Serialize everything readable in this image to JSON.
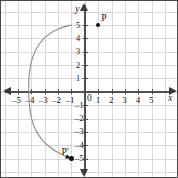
{
  "figure": {
    "title": "",
    "background_color": "#ffffff",
    "border_color": "#4a4a4a",
    "grid_color": "#d8d8d8",
    "axis_color": "#4f4f4f",
    "curve_color": "#8a8a8a",
    "point_color": "#111111"
  },
  "axes": {
    "x_name": "x",
    "y_name": "y",
    "origin_label": "0",
    "x_tick_labels": [
      "–5",
      "–4",
      "–3",
      "–2",
      "–1",
      "1",
      "2",
      "3",
      "4",
      "5"
    ],
    "y_tick_labels": [
      "5",
      "4",
      "3",
      "2",
      "1",
      "–1",
      "–2",
      "–3",
      "–4",
      "–5"
    ]
  },
  "points": [
    {
      "name": "P",
      "label": "P",
      "x": 1,
      "y": 5
    },
    {
      "name": "P'",
      "label": "P′",
      "x": -1,
      "y": -5
    }
  ],
  "chart_data": {
    "type": "line",
    "title": "",
    "xlabel": "x",
    "ylabel": "y",
    "xlim": [
      -5.6,
      5.6
    ],
    "ylim": [
      -5.6,
      5.6
    ],
    "grid": true,
    "legend": null,
    "xticks": [
      -5,
      -4,
      -3,
      -2,
      -1,
      0,
      1,
      2,
      3,
      4,
      5
    ],
    "yticks": [
      -5,
      -4,
      -3,
      -2,
      -1,
      0,
      1,
      2,
      3,
      4,
      5
    ],
    "annotations": [
      {
        "text": "P",
        "x": 1,
        "y": 5,
        "marker": "filled-circle"
      },
      {
        "text": "P′",
        "x": -1,
        "y": -5,
        "marker": "filled-circle"
      }
    ],
    "series": [
      {
        "name": "arc-from-P-start-to-P-prime",
        "kind": "open-arc",
        "arrow_end": "end",
        "description": "Leftward-opening arc starting near (-1, 5), bulging left to about x = -4.2 at y = 0, ending with an arrowhead at (-1, -5)",
        "x": [
          -1.0,
          -1.9,
          -2.7,
          -3.4,
          -3.9,
          -4.15,
          -4.2,
          -4.1,
          -3.8,
          -3.2,
          -2.4,
          -1.6,
          -1.05
        ],
        "y": [
          5.0,
          4.75,
          4.3,
          3.6,
          2.6,
          1.4,
          0.0,
          -1.4,
          -2.6,
          -3.6,
          -4.3,
          -4.75,
          -5.0
        ]
      }
    ]
  }
}
